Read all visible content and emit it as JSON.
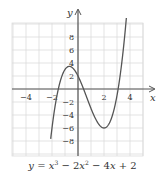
{
  "chart_data": {
    "type": "line",
    "title": "",
    "equation_label": "y = x³ − 2x² − 4x + 2",
    "equation_parts": {
      "y": "y",
      "eq": " = ",
      "x1": "x",
      "exp1": "3",
      "minus1": " − 2",
      "x2": "x",
      "exp2": "2",
      "minus2": " − 4",
      "x3": "x",
      "plus": " + 2"
    },
    "xlabel": "x",
    "ylabel": "y",
    "xlim": [
      -5,
      5
    ],
    "ylim": [
      -10.3,
      10.2
    ],
    "grid": true,
    "x_ticks": [
      -4,
      -2,
      2,
      4
    ],
    "x_tick_labels": [
      "−4",
      "−2",
      "2",
      "4"
    ],
    "y_ticks": [
      8,
      6,
      4,
      2,
      -2,
      -4,
      -6,
      -8
    ],
    "y_tick_labels": [
      "8",
      "6",
      "4",
      "2",
      "−2",
      "−4",
      "−6",
      "−8"
    ],
    "series": [
      {
        "name": "y = x^3 - 2x^2 - 4x + 2",
        "coefficients": [
          1,
          -2,
          -4,
          2
        ],
        "x": [
          -2.0,
          -1.5,
          -1.0,
          -0.67,
          0,
          0.5,
          1.0,
          1.5,
          2.0,
          2.5,
          3.0,
          3.5,
          3.8
        ],
        "values": [
          -6.0,
          -0.875,
          3.0,
          3.48,
          2.0,
          -0.375,
          -3.0,
          -5.125,
          -6.0,
          -4.875,
          -1.0,
          6.375,
          12.7
        ]
      }
    ],
    "annotations": {
      "local_max": [
        -0.67,
        3.48
      ],
      "local_min": [
        2,
        -6
      ]
    },
    "colors": {
      "curve": "#555555",
      "axes": "#555555",
      "grid": "#dcdcdc",
      "text": "#333333"
    }
  }
}
